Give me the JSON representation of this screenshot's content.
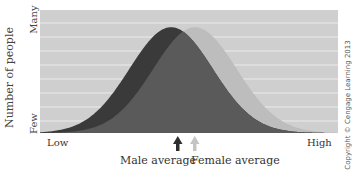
{
  "chart_data": {
    "type": "area",
    "title": "",
    "xlabel": "",
    "ylabel": "Number of people",
    "x_tick_labels": [
      "Low",
      "High"
    ],
    "y_tick_labels": [
      "Few",
      "Many"
    ],
    "grid": true,
    "series": [
      {
        "name": "Male",
        "color": "#3a3a3a",
        "distribution": "normal",
        "relative_mean": 0.44,
        "relative_sd": 0.14,
        "relative_peak": 0.86
      },
      {
        "name": "Female",
        "color": "#bdbdbd",
        "distribution": "normal",
        "relative_mean": 0.52,
        "relative_sd": 0.14,
        "relative_peak": 0.86
      }
    ],
    "overlap_color": "#5a5a5a",
    "annotations": [
      {
        "text": "Male average",
        "arrow_color": "#2e2e2e",
        "position": 0.44
      },
      {
        "text": "Female average",
        "arrow_color": "#c4c4c4",
        "position": 0.52
      }
    ]
  },
  "labels": {
    "ylabel": "Number of people",
    "y_many": "Many",
    "y_few": "Few",
    "x_low": "Low",
    "x_high": "High",
    "male_average": "Male average",
    "female_average": "Female average",
    "copyright": "Copyright © Cengage Learning 2013"
  },
  "colors": {
    "plot_bg": "#cfcfcf",
    "gridline": "#ebebeb",
    "male": "#3a3a3a",
    "female": "#bdbdbd",
    "overlap": "#5a5a5a"
  }
}
